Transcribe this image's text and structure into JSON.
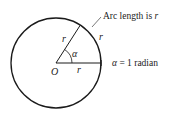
{
  "diagram": {
    "circle": {
      "cx": 56,
      "cy": 63,
      "r": 45,
      "stroke": "#1a1a1a"
    },
    "center_label": "O",
    "radius_label_horizontal": "r",
    "radius_label_slanted": "r",
    "arc_label": "r",
    "angle_label": "α",
    "arc_callout": {
      "prefix": "Arc length is ",
      "var": "r"
    },
    "equation": {
      "var": "α",
      "rest": " = 1 radian"
    }
  }
}
